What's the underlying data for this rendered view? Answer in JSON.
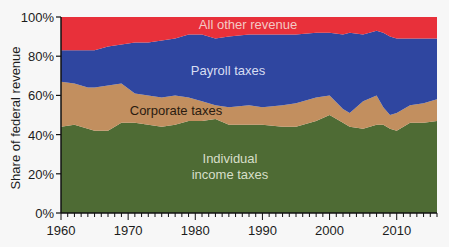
{
  "chart_data": {
    "type": "area",
    "stacked": true,
    "title": "",
    "xlabel": "",
    "ylabel": "Share of  federal revenue",
    "xlim": [
      1960,
      2016
    ],
    "ylim": [
      0,
      100
    ],
    "x_ticks": [
      1960,
      1970,
      1980,
      1990,
      2000,
      2010
    ],
    "y_ticks": [
      0,
      20,
      40,
      60,
      80,
      100
    ],
    "y_tick_labels": [
      "0%",
      "20%",
      "40%",
      "60%",
      "80%",
      "100%"
    ],
    "grid": false,
    "legend": "inline labels",
    "x": [
      1960,
      1962,
      1964,
      1965,
      1967,
      1969,
      1971,
      1973,
      1975,
      1977,
      1979,
      1981,
      1983,
      1985,
      1988,
      1990,
      1993,
      1995,
      1998,
      2000,
      2002,
      2003,
      2005,
      2007,
      2008,
      2009,
      2010,
      2012,
      2014,
      2016
    ],
    "series": [
      {
        "name": "Individual income taxes",
        "color": "#4e6b34",
        "values": [
          44,
          45,
          43,
          42,
          42,
          46,
          46,
          45,
          44,
          45,
          47,
          47,
          48,
          45,
          45,
          45,
          44,
          44,
          47,
          50,
          46,
          44,
          43,
          45,
          45,
          43,
          42,
          46,
          46,
          47
        ]
      },
      {
        "name": "Corporate taxes",
        "color": "#c28f5f",
        "values": [
          23,
          21,
          21,
          22,
          23,
          20,
          15,
          15,
          15,
          15,
          12,
          10,
          7,
          9,
          10,
          9,
          11,
          12,
          12,
          10,
          7,
          7,
          14,
          15,
          9,
          7,
          9,
          9,
          10,
          11
        ]
      },
      {
        "name": "Payroll taxes",
        "color": "#2f46a0",
        "values": [
          16,
          17,
          19,
          19,
          20,
          20,
          26,
          27,
          29,
          29,
          32,
          34,
          34,
          36,
          36,
          37,
          36,
          35,
          33,
          32,
          38,
          41,
          34,
          33,
          38,
          40,
          38,
          34,
          33,
          31
        ]
      },
      {
        "name": "All other revenue",
        "color": "#e8303a",
        "values": [
          17,
          17,
          17,
          17,
          15,
          14,
          13,
          13,
          12,
          11,
          9,
          9,
          11,
          10,
          9,
          9,
          9,
          9,
          8,
          8,
          9,
          8,
          9,
          7,
          8,
          10,
          11,
          11,
          11,
          11
        ]
      }
    ],
    "annotations": [
      {
        "text": "All other revenue",
        "x": 1991,
        "y": 96
      },
      {
        "text": "Payroll taxes",
        "x": 1990,
        "y": 75
      },
      {
        "text": "Corporate taxes",
        "x": 1976,
        "y": 55
      },
      {
        "text": "Individual",
        "x": 1990,
        "y": 29
      },
      {
        "text": "income taxes",
        "x": 1990,
        "y": 22
      }
    ]
  },
  "labels": {
    "ylabel": "Share of  federal revenue",
    "other": "All other revenue",
    "payroll": "Payroll taxes",
    "corporate": "Corporate taxes",
    "individual_1": "Individual",
    "individual_2": "income taxes"
  }
}
